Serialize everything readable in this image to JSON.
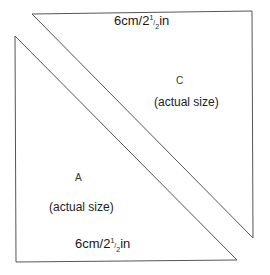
{
  "diagram": {
    "shapes": [
      {
        "id": "C",
        "label": "C",
        "note": "(actual size)",
        "dimension": {
          "whole": "6cm/2",
          "num": "1",
          "den": "2",
          "unit": "in",
          "full": "6cm/2½in"
        },
        "points": [
          [
            32,
            14
          ],
          [
            252,
            11
          ],
          [
            253,
            238
          ]
        ]
      },
      {
        "id": "A",
        "label": "A",
        "note": "(actual size)",
        "dimension": {
          "whole": "6cm/2",
          "num": "1",
          "den": "2",
          "unit": "in",
          "full": "6cm/2½in"
        },
        "points": [
          [
            15,
            36
          ],
          [
            16,
            262
          ],
          [
            237,
            260
          ]
        ]
      }
    ],
    "stroke_color": "#555555"
  }
}
